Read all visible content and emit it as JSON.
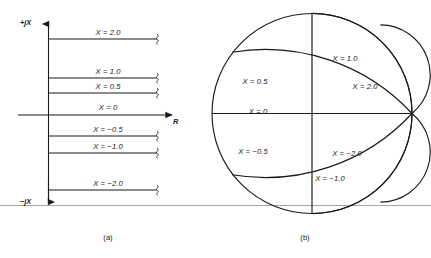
{
  "figure": {
    "panel_a": {
      "caption": "(a)",
      "axis_top_label": "+jX",
      "axis_bottom_label": "−jX",
      "axis_right_label": "R",
      "lines": [
        {
          "label": "X = 2.0",
          "value": 2.0,
          "y": 39,
          "label_y": 29,
          "label_x": 108
        },
        {
          "label": "X = 1.0",
          "value": 1.0,
          "y": 78,
          "label_y": 68,
          "label_x": 108
        },
        {
          "label": "X = 0.5",
          "value": 0.5,
          "y": 93,
          "label_y": 83,
          "label_x": 108
        },
        {
          "label": "X = 0",
          "value": 0.0,
          "y": 115,
          "label_y": 104,
          "label_x": 108
        },
        {
          "label": "X = −0.5",
          "value": -0.5,
          "y": 136,
          "label_y": 126,
          "label_x": 108
        },
        {
          "label": "X = −1.0",
          "value": -1.0,
          "y": 153,
          "label_y": 143,
          "label_x": 108
        },
        {
          "label": "X = −2.0",
          "value": -2.0,
          "y": 190,
          "label_y": 180,
          "label_x": 108
        }
      ]
    },
    "panel_b": {
      "caption": "(b)",
      "arcs": [
        {
          "label": "X = 1.0",
          "value": 1.0,
          "label_x": 345,
          "label_y": 55
        },
        {
          "label": "X = 2.0",
          "value": 2.0,
          "label_x": 365,
          "label_y": 83
        },
        {
          "label": "X = 0.5",
          "value": 0.5,
          "label_x": 255,
          "label_y": 78
        },
        {
          "label": "X = 0",
          "value": 0.0,
          "label_x": 258,
          "label_y": 108
        },
        {
          "label": "X = −0.5",
          "value": -0.5,
          "label_x": 253,
          "label_y": 148
        },
        {
          "label": "X = −2.0",
          "value": -2.0,
          "label_x": 347,
          "label_y": 150
        },
        {
          "label": "X = −1.0",
          "value": -1.0,
          "label_x": 330,
          "label_y": 175
        }
      ]
    }
  },
  "colors": {
    "ink": "#1a1a1a",
    "rule": "#9a9a9a",
    "background": "#ffffff"
  }
}
